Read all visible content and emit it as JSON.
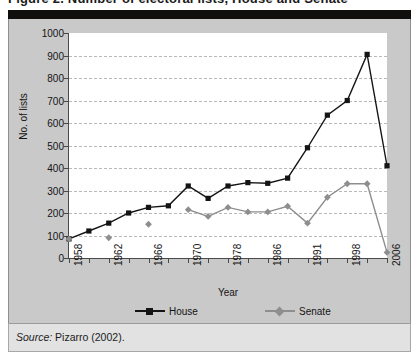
{
  "top_strip_text": "Figure 2. Number of electoral lists, House and Senate",
  "figure": {
    "source_prefix": "Source:",
    "source_text": " Pizarro (2002)."
  },
  "colors": {
    "house": "#141414",
    "senate": "#8e8e8e",
    "panel_bg": "#c9c9c9",
    "plot_bg": "#ffffff",
    "grid": "#b9b9b9",
    "axis": "#4a4a4a",
    "black_bar": "#100f0d",
    "footer_bg": "#e2e2e2"
  },
  "legend": {
    "house_label": "House",
    "senate_label": "Senate"
  },
  "chart_data": {
    "type": "line",
    "title": "",
    "xlabel": "Year",
    "ylabel": "No. of lists",
    "ylim": [
      0,
      1000
    ],
    "ytick_step": 100,
    "ytick_labels": [
      "0",
      "100",
      "200",
      "300",
      "400",
      "500",
      "600",
      "700",
      "800",
      "900",
      "1000"
    ],
    "grid": true,
    "legend_position": "bottom",
    "categories": [
      "1958",
      "1960",
      "1962",
      "1964",
      "1966",
      "1968",
      "1970",
      "1974",
      "1978",
      "1982",
      "1986",
      "1990",
      "1991",
      "1994",
      "1998",
      "2002",
      "2006"
    ],
    "xtick_labels": [
      "1958",
      "",
      "1962",
      "",
      "1966",
      "",
      "1970",
      "",
      "1978",
      "",
      "1986",
      "",
      "1991",
      "",
      "1998",
      "",
      "2006"
    ],
    "series": [
      {
        "name": "House",
        "color": "#141414",
        "marker": "square",
        "values": [
          85,
          120,
          155,
          200,
          225,
          232,
          320,
          265,
          320,
          335,
          332,
          355,
          490,
          635,
          700,
          905,
          410
        ]
      },
      {
        "name": "Senate",
        "color": "#8e8e8e",
        "marker": "diamond",
        "values": [
          85,
          null,
          90,
          null,
          150,
          null,
          215,
          185,
          225,
          205,
          205,
          230,
          155,
          270,
          330,
          330,
          25
        ]
      }
    ]
  }
}
